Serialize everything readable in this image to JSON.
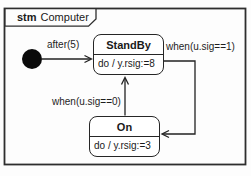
{
  "diagram": {
    "frame_keyword": "stm",
    "frame_title": "Computer"
  },
  "states": {
    "standby": {
      "name": "StandBy",
      "activity": "do / y.rsig:=8"
    },
    "on": {
      "name": "On",
      "activity": "do / y.rsig:=3"
    }
  },
  "transitions": {
    "initial_to_standby": {
      "label": "after(5)"
    },
    "standby_to_on": {
      "label": "when(u.sig==1)"
    },
    "on_to_standby": {
      "label": "when(u.sig==0)"
    }
  },
  "colors": {
    "line": "#222222",
    "state_border": "#262626",
    "state_fill": "#ffffff",
    "initial_node_fill": "#000000",
    "background": "#fdfdfd"
  }
}
